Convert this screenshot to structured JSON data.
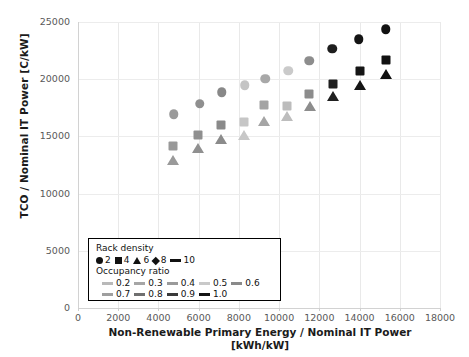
{
  "chart_data": {
    "type": "scatter",
    "title": "",
    "xlabel": "Non-Renewable Primary Energy / Nominal IT Power",
    "xlabel_units": "[kWh/kW]",
    "ylabel": "TCO / Nominal IT Power  [C/kW]",
    "xlim": [
      0,
      18000
    ],
    "ylim": [
      0,
      25000
    ],
    "xticks": [
      0,
      2000,
      4000,
      6000,
      8000,
      10000,
      12000,
      14000,
      16000,
      18000
    ],
    "yticks": [
      0,
      5000,
      10000,
      15000,
      20000,
      25000
    ],
    "grid": true,
    "legend_position": "inside-bottom-left",
    "legend": {
      "rack_density_title": "Rack density",
      "rack_density": [
        {
          "label": "2",
          "marker": "circle"
        },
        {
          "label": "4",
          "marker": "square"
        },
        {
          "label": "6",
          "marker": "triangle"
        },
        {
          "label": "8",
          "marker": "diamond"
        },
        {
          "label": "10",
          "marker": "line"
        }
      ],
      "occupancy_title": "Occupancy ratio",
      "occupancy": [
        {
          "label": "0.2",
          "color": "#b9b9b9"
        },
        {
          "label": "0.3",
          "color": "#a6a6a6"
        },
        {
          "label": "0.4",
          "color": "#9a9a9a"
        },
        {
          "label": "0.5",
          "color": "#c9c9c9"
        },
        {
          "label": "0.6",
          "color": "#8a8a8a"
        },
        {
          "label": "0.7",
          "color": "#9f9f9f"
        },
        {
          "label": "0.8",
          "color": "#6f6f6f"
        },
        {
          "label": "0.9",
          "color": "#3a3a3a"
        },
        {
          "label": "1.0",
          "color": "#141414"
        }
      ]
    },
    "series": [
      {
        "name": "Rack density 2",
        "marker": "circle",
        "points": [
          {
            "x": 4750,
            "y": 16950,
            "color": "#9a9a9a"
          },
          {
            "x": 6050,
            "y": 17850,
            "color": "#8f8f8f"
          },
          {
            "x": 7150,
            "y": 18850,
            "color": "#888888"
          },
          {
            "x": 8300,
            "y": 19450,
            "color": "#c4c4c4"
          },
          {
            "x": 9300,
            "y": 20050,
            "color": "#a8a8a8"
          },
          {
            "x": 10450,
            "y": 20750,
            "color": "#cacaca"
          },
          {
            "x": 11500,
            "y": 21600,
            "color": "#8d8d8d"
          },
          {
            "x": 12650,
            "y": 22650,
            "color": "#1e1e1e"
          },
          {
            "x": 13950,
            "y": 23500,
            "color": "#141414"
          },
          {
            "x": 15300,
            "y": 24350,
            "color": "#111111"
          }
        ]
      },
      {
        "name": "Rack density 4",
        "marker": "square",
        "points": [
          {
            "x": 4700,
            "y": 14200,
            "color": "#999999"
          },
          {
            "x": 5950,
            "y": 15150,
            "color": "#8f8f8f"
          },
          {
            "x": 7100,
            "y": 16000,
            "color": "#8a8a8a"
          },
          {
            "x": 8250,
            "y": 16250,
            "color": "#c6c6c6"
          },
          {
            "x": 9250,
            "y": 17750,
            "color": "#a3a3a3"
          },
          {
            "x": 10400,
            "y": 17700,
            "color": "#bcbcbc"
          },
          {
            "x": 11500,
            "y": 18700,
            "color": "#8c8c8c"
          },
          {
            "x": 12700,
            "y": 19600,
            "color": "#1f1f1f"
          },
          {
            "x": 14000,
            "y": 20700,
            "color": "#151515"
          },
          {
            "x": 15300,
            "y": 21700,
            "color": "#111111"
          }
        ]
      },
      {
        "name": "Rack density 6",
        "marker": "triangle",
        "points": [
          {
            "x": 4700,
            "y": 12900,
            "color": "#9a9a9a"
          },
          {
            "x": 5950,
            "y": 13950,
            "color": "#909090"
          },
          {
            "x": 7100,
            "y": 14750,
            "color": "#8b8b8b"
          },
          {
            "x": 8250,
            "y": 15100,
            "color": "#c7c7c7"
          },
          {
            "x": 9250,
            "y": 16350,
            "color": "#a5a5a5"
          },
          {
            "x": 10400,
            "y": 16750,
            "color": "#bdbdbd"
          },
          {
            "x": 11550,
            "y": 17700,
            "color": "#8d8d8d"
          },
          {
            "x": 12700,
            "y": 18550,
            "color": "#202020"
          },
          {
            "x": 14000,
            "y": 19500,
            "color": "#151515"
          },
          {
            "x": 15300,
            "y": 20450,
            "color": "#111111"
          }
        ]
      }
    ]
  }
}
